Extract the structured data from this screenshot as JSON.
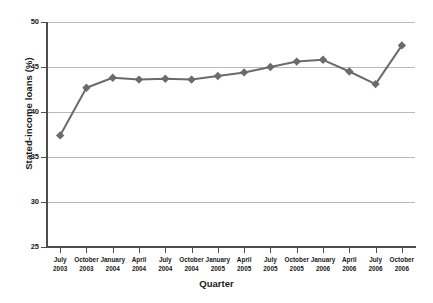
{
  "chart_data": {
    "type": "line",
    "title": "",
    "subtitle": "",
    "xlabel": "Quarter",
    "ylabel": "Stated-income loans (%)",
    "categories": [
      "July\n2003",
      "October\n2003",
      "January\n2004",
      "April\n2004",
      "July\n2004",
      "October\n2004",
      "January\n2005",
      "April\n2005",
      "July\n2005",
      "October\n2005",
      "January\n2006",
      "April\n2006",
      "July\n2006",
      "October\n2006"
    ],
    "category_lines": [
      [
        "July",
        "2003"
      ],
      [
        "October",
        "2003"
      ],
      [
        "January",
        "2004"
      ],
      [
        "April",
        "2004"
      ],
      [
        "July",
        "2004"
      ],
      [
        "October",
        "2004"
      ],
      [
        "January",
        "2005"
      ],
      [
        "April",
        "2005"
      ],
      [
        "July",
        "2005"
      ],
      [
        "October",
        "2005"
      ],
      [
        "January",
        "2006"
      ],
      [
        "April",
        "2006"
      ],
      [
        "July",
        "2006"
      ],
      [
        "October",
        "2006"
      ]
    ],
    "values": [
      37.4,
      42.7,
      43.8,
      43.6,
      43.7,
      43.6,
      44.0,
      44.4,
      45.0,
      45.6,
      45.8,
      44.5,
      43.1,
      47.4
    ],
    "ylim": [
      25,
      50
    ],
    "yticks": [
      25,
      30,
      35,
      40,
      45,
      50
    ],
    "ytick_labels": [
      "25",
      "30",
      "35",
      "40",
      "45",
      "50"
    ],
    "grid": true,
    "grid_axis": "y",
    "legend": false,
    "legend_position": "none",
    "marker": "diamond",
    "series_color": "#6b6b6b",
    "grid_color": "#b9b9b9",
    "axis_color": "#4d4d4d",
    "background_color": "#ffffff"
  }
}
